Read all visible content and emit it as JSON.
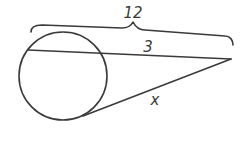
{
  "diagram": {
    "type": "geometry-secant-tangent",
    "labels": {
      "whole_secant": "12",
      "external_segment": "3",
      "tangent": "x"
    },
    "colors": {
      "stroke": "#3a3a3a",
      "background": "#ffffff"
    }
  }
}
